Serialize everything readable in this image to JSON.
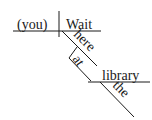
{
  "diagram": {
    "type": "sentence-diagram",
    "subject": "(you)",
    "verb": "Wait",
    "adverb": "here",
    "preposition": "at",
    "object_of_preposition": "library",
    "article": "the",
    "colors": {
      "ink": "#1a1a1a",
      "background": "#ffffff"
    }
  }
}
